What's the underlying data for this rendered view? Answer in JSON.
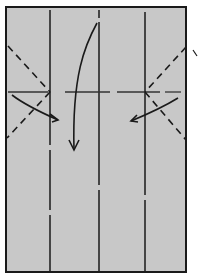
{
  "diagram": {
    "type": "origami-fold-diagram",
    "paper_color": "#c8c8c8",
    "line_color": "#1a1a1a",
    "sheet": {
      "x": 6,
      "y": 7,
      "width": 180,
      "height": 265
    },
    "valley_folds_vertical_x": [
      50,
      99,
      145
    ],
    "horizontal_dashed_fold_y": 92,
    "arrows": [
      {
        "name": "center-fold-down-arrow",
        "direction": "down"
      },
      {
        "name": "left-fold-in-arrow",
        "direction": "right"
      },
      {
        "name": "right-fold-in-arrow",
        "direction": "left"
      }
    ]
  }
}
